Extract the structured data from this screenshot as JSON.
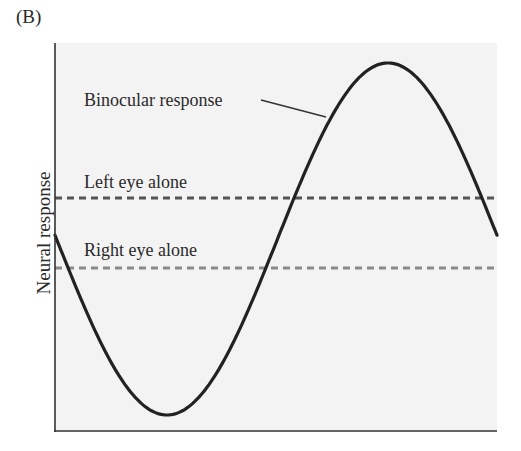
{
  "panel_label": "(B)",
  "chart_data": {
    "type": "line",
    "title": "",
    "xlabel": "",
    "ylabel": "Neural response",
    "grid": false,
    "ticks": "none",
    "series": [
      {
        "name": "Binocular response",
        "style": "solid",
        "color": "#222222",
        "shape": "sinusoid",
        "description": "starts mid-low, dips to minimum, rises to maximum above both monocular levels, falls back",
        "points_px": [
          [
            55,
            232
          ],
          [
            167,
            415
          ],
          [
            388,
            63
          ],
          [
            498,
            231
          ]
        ]
      },
      {
        "name": "Left eye alone",
        "style": "dashed",
        "color": "#555555",
        "level_px": 198
      },
      {
        "name": "Right eye alone",
        "style": "dashed",
        "color": "#8a8a8a",
        "level_px": 268
      }
    ],
    "annotations": [
      {
        "text": "Binocular response",
        "type": "label-with-leader"
      },
      {
        "text": "Left eye alone",
        "type": "label"
      },
      {
        "text": "Right eye alone",
        "type": "label"
      }
    ]
  },
  "labels": {
    "binocular": "Binocular response",
    "left": "Left eye alone",
    "right": "Right eye alone",
    "ylabel": "Neural response"
  },
  "colors": {
    "plot_bg": "#f3f3f3",
    "axis": "#333333",
    "curve": "#222222",
    "left_dash": "#555555",
    "right_dash": "#8a8a8a"
  }
}
